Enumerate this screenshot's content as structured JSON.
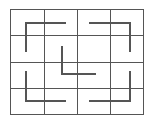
{
  "diagram": {
    "type": "grid-maze",
    "rows": 4,
    "cols": 4,
    "grid": {
      "x0": 10,
      "y0": 9,
      "x1": 143,
      "y1": 114,
      "color": "#555555",
      "stroke_width": 1,
      "vertical_lines": [
        10,
        44,
        77,
        110,
        143
      ],
      "horizontal_lines": [
        9,
        35,
        62,
        88,
        114
      ]
    },
    "segments_color": "#555555",
    "segments_width": 2,
    "segments": [
      {
        "name": "top-left-corner",
        "points": "65,23 26,23 26,51"
      },
      {
        "name": "top-right-corner",
        "points": "90,23 130,23 130,51"
      },
      {
        "name": "center-corner",
        "points": "62,47 62,74 95,74"
      },
      {
        "name": "bottom-left-corner",
        "points": "26,72 26,101 65,101"
      },
      {
        "name": "bottom-right-corner",
        "points": "130,72 130,101 90,101"
      }
    ]
  }
}
